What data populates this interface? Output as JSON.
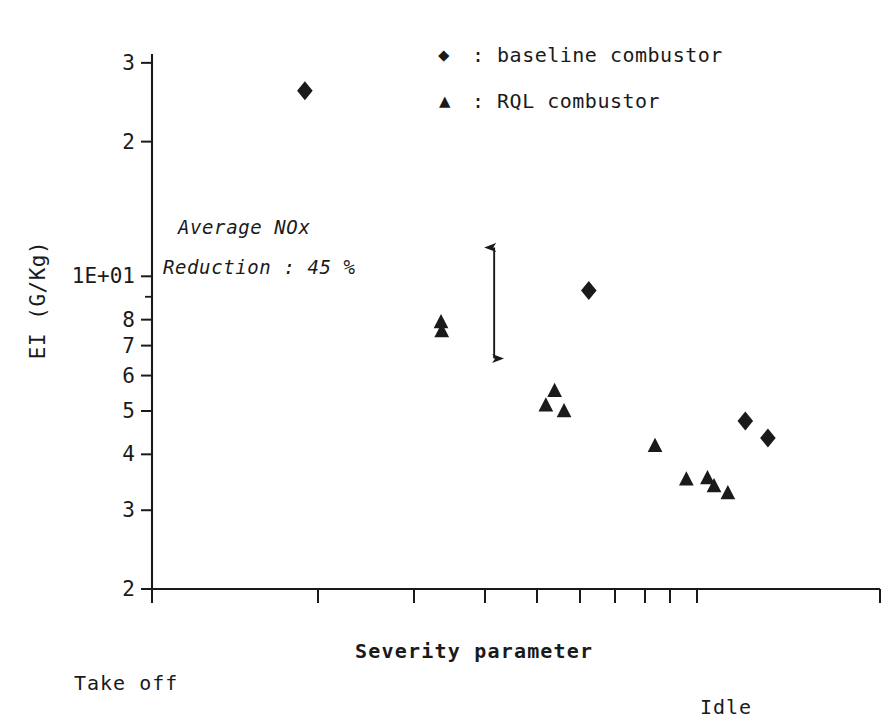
{
  "chart_data": {
    "type": "scatter",
    "title": "",
    "xlabel": "Severity parameter",
    "ylabel": "EI (G/Kg)",
    "yscale": "log",
    "ylim": [
      2,
      30
    ],
    "ytick_labels": [
      "3",
      "2",
      "1E+01",
      "8",
      "7",
      "6",
      "5",
      "4",
      "3",
      "2"
    ],
    "ytick_values": [
      30,
      20,
      10,
      8,
      7,
      6,
      5,
      4,
      3,
      2
    ],
    "yminor_values": [
      9
    ],
    "xlim": [
      0,
      1
    ],
    "xtick_labels": [],
    "grid": false,
    "legend_position": "top-right",
    "x_axis_note": "unlabeled ticks, spacing compresses toward the right",
    "x_endpoint_left": "Take off",
    "x_endpoint_right": "Idle",
    "series": [
      {
        "name": "baseline combustor",
        "marker": "diamond",
        "color": "#1a1a1a",
        "points": [
          {
            "x": 0.21,
            "y": 26.0
          },
          {
            "x": 0.6,
            "y": 9.3
          },
          {
            "x": 0.815,
            "y": 4.75
          },
          {
            "x": 0.846,
            "y": 4.35
          }
        ]
      },
      {
        "name": "RQL combustor",
        "marker": "triangle",
        "color": "#1a1a1a",
        "points": [
          {
            "x": 0.397,
            "y": 7.9
          },
          {
            "x": 0.398,
            "y": 7.55
          },
          {
            "x": 0.553,
            "y": 5.55
          },
          {
            "x": 0.541,
            "y": 5.15
          },
          {
            "x": 0.566,
            "y": 5.0
          },
          {
            "x": 0.691,
            "y": 4.18
          },
          {
            "x": 0.734,
            "y": 3.52
          },
          {
            "x": 0.763,
            "y": 3.54
          },
          {
            "x": 0.772,
            "y": 3.4
          },
          {
            "x": 0.791,
            "y": 3.28
          }
        ]
      }
    ],
    "annotations": [
      {
        "name": "nox-reduction-note",
        "lines": [
          "Average NOx",
          "Reduction : 45 %"
        ],
        "style": "italic"
      },
      {
        "name": "reduction-arrow",
        "type": "double-headed-vertical-arrow",
        "x": 0.47,
        "y_top": 11.6,
        "y_bottom": 6.55
      }
    ]
  },
  "legend": {
    "entries": [
      {
        "marker": "diamond-marker-icon",
        "separator": ":",
        "label": "baseline combustor"
      },
      {
        "marker": "triangle-marker-icon",
        "separator": ":",
        "label": "RQL combustor"
      }
    ]
  },
  "axes": {
    "x_title": "Severity parameter",
    "y_title": "EI (G/Kg)",
    "left_endpoint": "Take off",
    "right_endpoint": "Idle"
  },
  "annotation": {
    "line1": "Average NOx",
    "line2": "Reduction : 45 %"
  },
  "colors": {
    "ink": "#1a1a1a",
    "background": "#ffffff"
  }
}
